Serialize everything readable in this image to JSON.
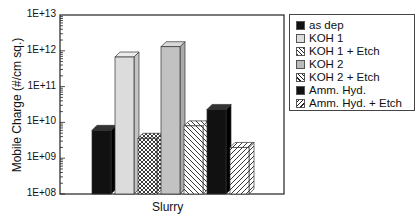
{
  "chart_data": {
    "type": "bar",
    "title": "",
    "xlabel": "Slurry",
    "ylabel": "Mobile Charge (#/cm sq.)",
    "yscale": "log",
    "ylim": [
      100000000.0,
      10000000000000.0
    ],
    "yticks": [
      "1E+08",
      "1E+09",
      "1E+10",
      "1E+11",
      "1E+12",
      "1E+13"
    ],
    "categories": [
      "Slurry"
    ],
    "grid": false,
    "legend_position": "right",
    "style": "3d-bars",
    "series": [
      {
        "name": "as dep",
        "values": [
          6000000000.0
        ],
        "fill": "solid-black"
      },
      {
        "name": "KOH 1",
        "values": [
          670000000000.0
        ],
        "fill": "light-gray"
      },
      {
        "name": "KOH 1 + Etch",
        "values": [
          3600000000.0
        ],
        "fill": "crosshatch"
      },
      {
        "name": "KOH 2",
        "values": [
          1300000000000.0
        ],
        "fill": "gray"
      },
      {
        "name": "KOH 2 + Etch",
        "values": [
          8000000000.0
        ],
        "fill": "diagonal-back"
      },
      {
        "name": "Amm. Hyd.",
        "values": [
          23000000000.0
        ],
        "fill": "solid-black"
      },
      {
        "name": "Amm. Hyd. + Etch",
        "values": [
          2000000000.0
        ],
        "fill": "diagonal-forward"
      }
    ]
  },
  "legend": {
    "items": [
      {
        "label": "as dep"
      },
      {
        "label": "KOH 1"
      },
      {
        "label": "KOH 1 + Etch"
      },
      {
        "label": "KOH 2"
      },
      {
        "label": "KOH 2 + Etch"
      },
      {
        "label": "Amm. Hyd."
      },
      {
        "label": "Amm. Hyd. + Etch"
      }
    ]
  },
  "axis": {
    "y_label": "Mobile Charge (#/cm sq.)",
    "x_label": "Slurry",
    "ticks": [
      "1E+13",
      "1E+12",
      "1E+11",
      "1E+10",
      "1E+09",
      "1E+08"
    ]
  }
}
